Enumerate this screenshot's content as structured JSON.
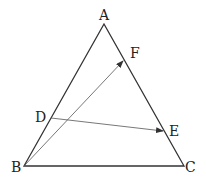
{
  "diagram": {
    "type": "geometry-triangle-vectors",
    "points": {
      "A": {
        "label": "A",
        "x": 104,
        "y": 24
      },
      "B": {
        "label": "B",
        "x": 24,
        "y": 166
      },
      "C": {
        "label": "C",
        "x": 184,
        "y": 166
      },
      "D": {
        "label": "D",
        "x": 50,
        "y": 118
      },
      "E": {
        "label": "E",
        "x": 164,
        "y": 131
      },
      "F": {
        "label": "F",
        "x": 124,
        "y": 60
      }
    },
    "segments": [
      {
        "from": "A",
        "to": "B"
      },
      {
        "from": "B",
        "to": "C"
      },
      {
        "from": "C",
        "to": "A"
      }
    ],
    "vectors": [
      {
        "from": "B",
        "to": "F"
      },
      {
        "from": "D",
        "to": "E"
      }
    ],
    "colors": {
      "line": "#333333",
      "vector": "#444444",
      "text": "#222222"
    }
  }
}
